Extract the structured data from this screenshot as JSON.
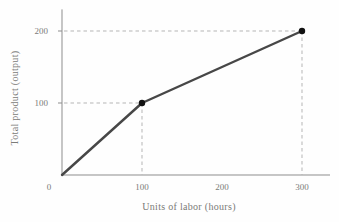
{
  "chart_data": {
    "type": "line",
    "title": "",
    "xlabel": "Units of labor (hours)",
    "ylabel": "Total product (output)",
    "series": [
      {
        "name": "Total product",
        "x": [
          0,
          100,
          300
        ],
        "y": [
          0,
          100,
          200
        ]
      }
    ],
    "marked_points": [
      [
        100,
        100
      ],
      [
        300,
        200
      ]
    ],
    "x_ticks": [
      0,
      100,
      200,
      300
    ],
    "y_ticks": [
      100,
      200
    ],
    "xlim": [
      0,
      335
    ],
    "ylim": [
      0,
      230
    ],
    "legend": "none",
    "grid": "off",
    "guides": "dashed reference lines from axes to marked points",
    "colors": {
      "line": "#474747",
      "marker": "#111111",
      "axis": "#8d8d8d",
      "guide": "#b5b5b5",
      "label": "#7b7b78",
      "background": "#fefefe"
    }
  }
}
